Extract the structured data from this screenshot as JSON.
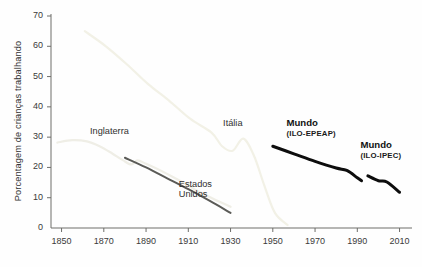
{
  "chart_data": {
    "type": "line",
    "title": "",
    "xlabel": "",
    "ylabel": "Porcentagem de crianças trabalhando",
    "xlim": [
      1845,
      2014
    ],
    "ylim": [
      0,
      70
    ],
    "xticks": [
      1850,
      1870,
      1890,
      1910,
      1930,
      1950,
      1970,
      1990,
      2010
    ],
    "xtick_labels": [
      "1850",
      "1870",
      "1890",
      "1910",
      "1930",
      "1950",
      "1970",
      "1990",
      "2010"
    ],
    "yticks": [
      0,
      10,
      20,
      30,
      40,
      50,
      60,
      70
    ],
    "ytick_labels": [
      "0",
      "10",
      "20",
      "30",
      "40",
      "50",
      "60",
      "70"
    ],
    "grid": false,
    "legend_position": "inline-annotations",
    "series": [
      {
        "name": "Inglaterra",
        "label": "Inglaterra",
        "label_sub": "",
        "color": "#efeee6",
        "width": 2.2,
        "points": [
          [
            1848,
            28.2
          ],
          [
            1855,
            29.0
          ],
          [
            1862,
            28.6
          ],
          [
            1868,
            27.0
          ],
          [
            1874,
            24.6
          ],
          [
            1879,
            22.4
          ],
          [
            1883,
            21.0
          ],
          [
            1886,
            22.3
          ],
          [
            1890,
            21.2
          ],
          [
            1898,
            18.6
          ],
          [
            1906,
            15.6
          ],
          [
            1914,
            12.4
          ],
          [
            1922,
            9.6
          ],
          [
            1930,
            7.0
          ]
        ]
      },
      {
        "name": "Estados Unidos",
        "label": "Estados",
        "label_sub": "Unidos",
        "color": "#5b5b57",
        "width": 2.0,
        "points": [
          [
            1880,
            23.2
          ],
          [
            1890,
            20.0
          ],
          [
            1900,
            16.4
          ],
          [
            1910,
            12.8
          ],
          [
            1920,
            9.0
          ],
          [
            1930,
            5.0
          ]
        ]
      },
      {
        "name": "Itália",
        "label": "Itália",
        "label_sub": "",
        "color": "#f2f1e6",
        "width": 2.2,
        "points": [
          [
            1861,
            65.0
          ],
          [
            1871,
            60.0
          ],
          [
            1881,
            54.0
          ],
          [
            1891,
            47.5
          ],
          [
            1901,
            42.0
          ],
          [
            1911,
            36.0
          ],
          [
            1921,
            31.5
          ],
          [
            1926,
            27.0
          ],
          [
            1931,
            25.5
          ],
          [
            1936,
            29.5
          ],
          [
            1941,
            24.0
          ],
          [
            1946,
            14.0
          ],
          [
            1951,
            5.0
          ],
          [
            1957,
            1.0
          ]
        ]
      },
      {
        "name": "Mundo (ILO-EPEAP)",
        "label": "Mundo",
        "label_sub": "(ILO-EPEAP)",
        "color": "#0d0d0d",
        "width": 3.0,
        "points": [
          [
            1950,
            27.0
          ],
          [
            1960,
            24.5
          ],
          [
            1970,
            22.0
          ],
          [
            1980,
            19.8
          ],
          [
            1985,
            19.0
          ],
          [
            1990,
            16.6
          ],
          [
            1992,
            15.6
          ]
        ]
      },
      {
        "name": "Mundo (ILO-IPEC)",
        "label": "Mundo",
        "label_sub": "(ILO-IPEC)",
        "color": "#0d0d0d",
        "width": 3.0,
        "points": [
          [
            1995,
            17.2
          ],
          [
            2000,
            15.6
          ],
          [
            2004,
            15.2
          ],
          [
            2010,
            11.8
          ]
        ]
      }
    ],
    "annotations": [
      {
        "text": "Inglaterra",
        "x": 1872,
        "y": 31.5,
        "bold": false
      },
      {
        "text": "Estados",
        "x": 1914,
        "y": 14.0,
        "bold": false
      },
      {
        "text": "Unidos",
        "x": 1914,
        "y": 10.5,
        "bold": false
      },
      {
        "text": "Itália",
        "x": 1935,
        "y": 34.0,
        "bold": false
      },
      {
        "text": "Mundo",
        "x": 1965,
        "y": 34.5,
        "bold": true
      },
      {
        "text": "(ILO-EPEAP)",
        "x": 1965,
        "y": 30.5,
        "bold": false
      },
      {
        "text": "Mundo",
        "x": 2000,
        "y": 27.0,
        "bold": true
      },
      {
        "text": "(ILO-IPEC)",
        "x": 2000,
        "y": 23.0,
        "bold": false
      }
    ]
  },
  "axis": {
    "y_title": "Porcentagem de crianças trabalhando",
    "line_color": "#6e6e6a"
  },
  "labels": {
    "inglaterra": "Inglaterra",
    "estados": "Estados",
    "unidos": "Unidos",
    "italia": "Itália",
    "mundo_1": "Mundo",
    "mundo_1_sub": "(ILO-EPEAP)",
    "mundo_2": "Mundo",
    "mundo_2_sub": "(ILO-IPEC)"
  }
}
